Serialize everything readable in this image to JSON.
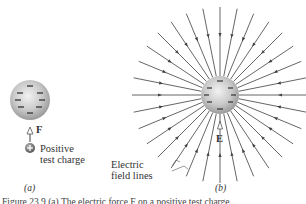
{
  "panel_a": {
    "label": "(a)",
    "force_label": "F",
    "test_charge_label_line1": "Positive",
    "test_charge_label_line2": "test charge",
    "sphere_charge_signs": [
      "−",
      "−",
      "−",
      "−",
      "−",
      "−",
      "−",
      "−"
    ]
  },
  "panel_b": {
    "label": "(b)",
    "field_label": "E",
    "field_lines_label_line1": "Electric",
    "field_lines_label_line2": "field lines",
    "line_count": 32
  },
  "caption": "Figure 23.9 (a) The electric force F on a positive test charge..."
}
